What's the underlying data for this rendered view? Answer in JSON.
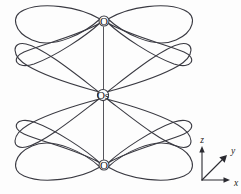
{
  "figure": {
    "kind": "molecular-orbital-diagram",
    "width": 241,
    "height": 194,
    "background_color": "#fdfdfd",
    "line_color": "#3a3a42",
    "bond_color": "#55555c",
    "label_color": "#222228"
  },
  "atoms": [
    {
      "id": "oxygen-top",
      "label": "O",
      "cx": 104,
      "cy": 21,
      "r": 5.0
    },
    {
      "id": "osmium-center",
      "label": "Os",
      "cx": 103,
      "cy": 95,
      "r": 5.6
    },
    {
      "id": "oxygen-bottom",
      "label": "O",
      "cx": 104,
      "cy": 165,
      "r": 5.0
    }
  ],
  "bonds": [
    {
      "id": "bond-top",
      "from": "oxygen-top",
      "to": "osmium-center"
    },
    {
      "id": "bond-bottom",
      "from": "osmium-center",
      "to": "oxygen-bottom"
    }
  ],
  "orbital_lobes": {
    "count_per_atom": 4,
    "pattern": "x-shaped four-lobe set, elongated teardrops",
    "atoms_with_lobes": [
      "oxygen-top",
      "osmium-center",
      "oxygen-bottom"
    ]
  },
  "axis_triad": {
    "origin_x": 202,
    "origin_y": 180,
    "axes": [
      {
        "name": "z",
        "label": "z",
        "tip_x": 202,
        "tip_y": 148,
        "label_x": 202,
        "label_y": 141
      },
      {
        "name": "y",
        "label": "y",
        "tip_x": 226,
        "tip_y": 156,
        "label_x": 233,
        "label_y": 152
      },
      {
        "name": "x",
        "label": "x",
        "tip_x": 230,
        "tip_y": 180,
        "label_x": 236,
        "label_y": 183
      }
    ]
  }
}
